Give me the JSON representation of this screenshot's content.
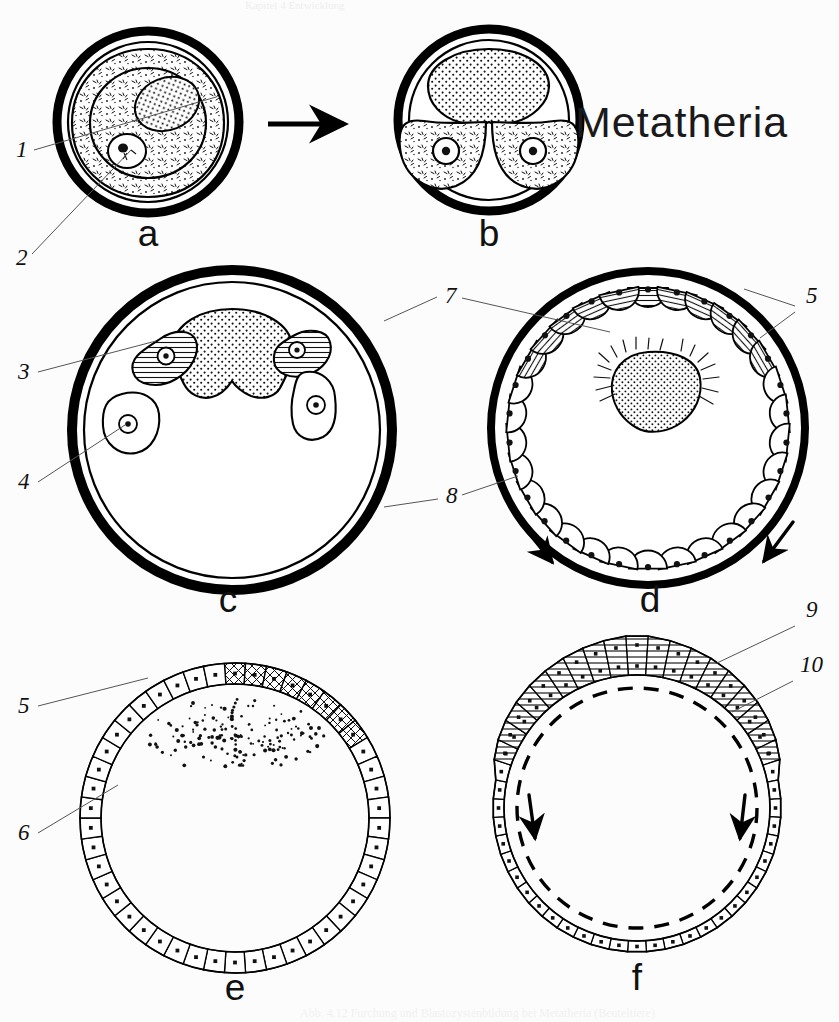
{
  "figure": {
    "title": "Metatheria",
    "header_text": "Kapitel 4  Entwicklung",
    "caption_text": "Abb. 4.12  Furchung und Blastozystenbildung bei Metatheria (Beuteltiere)",
    "ink_color": "#000000",
    "leader_color": "#555555"
  },
  "panels": [
    {
      "id": "a",
      "letter": "a",
      "name": "zygote-with-yolk-mass",
      "cx": 148,
      "cy": 122,
      "r_outer": 91,
      "r_inner": 80,
      "letter_x": 148,
      "letter_y": 246
    },
    {
      "id": "b",
      "letter": "b",
      "name": "two-cell-stage",
      "cx": 489,
      "cy": 120,
      "r_outer": 91,
      "r_inner": 80,
      "letter_x": 489,
      "letter_y": 246
    },
    {
      "id": "c",
      "letter": "c",
      "name": "early-cleavage-blastomeres",
      "cx": 232,
      "cy": 430,
      "r_outer": 160,
      "r_inner": 148,
      "letter_x": 228,
      "letter_y": 612
    },
    {
      "id": "d",
      "letter": "d",
      "name": "blastomeres-spreading-on-zona",
      "cx": 648,
      "cy": 428,
      "r_outer": 157,
      "r_inner": 150,
      "letter_x": 650,
      "letter_y": 612
    },
    {
      "id": "e",
      "letter": "e",
      "name": "unilaminar-blastocyst",
      "cx": 235,
      "cy": 818,
      "r_outer": 155,
      "r_inner": 134,
      "letter_x": 235,
      "letter_y": 1000
    },
    {
      "id": "f",
      "letter": "f",
      "name": "bilaminar-blastocyst",
      "cx": 637,
      "cy": 808,
      "r_outer": 160,
      "r_inner": 135,
      "letter_x": 637,
      "letter_y": 990
    }
  ],
  "reference_numbers": [
    {
      "num": "1",
      "x": 16,
      "y": 157,
      "name": "ref-1-cytoplasm",
      "leader": "M 34 150 L 216 97"
    },
    {
      "num": "2",
      "x": 16,
      "y": 265,
      "name": "ref-2-nucleus",
      "leader": "M 32 254 L 131 150"
    },
    {
      "num": "3",
      "x": 18,
      "y": 379,
      "name": "ref-3-hatched-blastomere",
      "leader": "M 38 372 L 156 341"
    },
    {
      "num": "4",
      "x": 18,
      "y": 489,
      "name": "ref-4-clear-blastomere",
      "leader": "M 38 482 L 125 425"
    },
    {
      "num": "5",
      "x": 18,
      "y": 713,
      "name": "ref-5-embryonic-cells",
      "leader": "M 38 706 L 148 678"
    },
    {
      "num": "6",
      "x": 18,
      "y": 840,
      "name": "ref-6-trophoblast-cells",
      "leader": "M 38 833 L 118 785"
    },
    {
      "num": "7",
      "x": 445,
      "y": 303,
      "name": "ref-7-yolk-mass",
      "leader": "M 384 321 L 437 297 M 462 298 L 610 332"
    },
    {
      "num": "8",
      "x": 446,
      "y": 503,
      "name": "ref-8-zona-pellucida",
      "leader": "M 384 507 L 438 499 M 462 495 L 518 476"
    },
    {
      "num": "9",
      "x": 806,
      "y": 617,
      "name": "ref-9-embryonic-disc",
      "leader": "M 795 626 L 717 663"
    },
    {
      "num": "10",
      "x": 800,
      "y": 672,
      "name": "ref-10-endoderm-layer",
      "leader": "M 793 681 L 732 712"
    },
    {
      "num": "5",
      "x": 806,
      "y": 303,
      "name": "ref-5-right-embryonic-cells",
      "leader": "M 795 306 L 744 289 M 795 312 L 760 338"
    }
  ],
  "transition_arrow": {
    "name": "stage-transition-arrow",
    "x1": 268,
    "y1": 124,
    "x2": 348,
    "y2": 124
  }
}
